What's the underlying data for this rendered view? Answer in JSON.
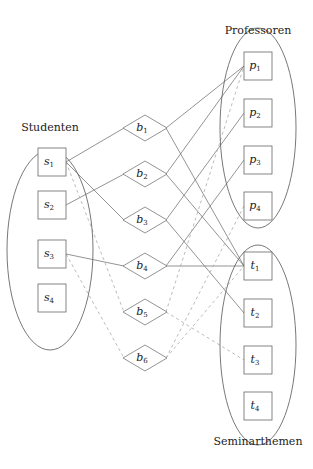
{
  "groups": {
    "students": {
      "label": "Studenten",
      "cx": 50,
      "cy": 250,
      "rx": 43,
      "ry": 100,
      "label_x": 50,
      "label_y": 131
    },
    "professors": {
      "label": "Professoren",
      "cx": 258,
      "cy": 128,
      "rx": 38,
      "ry": 100,
      "label_x": 258,
      "label_y": 34
    },
    "topics": {
      "label": "Seminarthemen",
      "cx": 258,
      "cy": 345,
      "rx": 38,
      "ry": 100,
      "label_x": 258,
      "label_y": 445
    }
  },
  "nodes": {
    "s1": {
      "base": "s",
      "sub": "1",
      "x": 52,
      "y": 162,
      "shape": "box"
    },
    "s2": {
      "base": "s",
      "sub": "2",
      "x": 52,
      "y": 205,
      "shape": "box"
    },
    "s3": {
      "base": "s",
      "sub": "3",
      "x": 52,
      "y": 254,
      "shape": "box"
    },
    "s4": {
      "base": "s",
      "sub": "4",
      "x": 52,
      "y": 298,
      "shape": "box"
    },
    "b1": {
      "base": "b",
      "sub": "1",
      "x": 145,
      "y": 128,
      "shape": "diamond"
    },
    "b2": {
      "base": "b",
      "sub": "2",
      "x": 145,
      "y": 174,
      "shape": "diamond"
    },
    "b3": {
      "base": "b",
      "sub": "3",
      "x": 145,
      "y": 220,
      "shape": "diamond"
    },
    "b4": {
      "base": "b",
      "sub": "4",
      "x": 145,
      "y": 266,
      "shape": "diamond"
    },
    "b5": {
      "base": "b",
      "sub": "5",
      "x": 145,
      "y": 312,
      "shape": "diamond"
    },
    "b6": {
      "base": "b",
      "sub": "6",
      "x": 145,
      "y": 358,
      "shape": "diamond"
    },
    "p1": {
      "base": "p",
      "sub": "1",
      "x": 258,
      "y": 66,
      "shape": "box"
    },
    "p2": {
      "base": "p",
      "sub": "2",
      "x": 258,
      "y": 113,
      "shape": "box"
    },
    "p3": {
      "base": "p",
      "sub": "3",
      "x": 258,
      "y": 160,
      "shape": "box"
    },
    "p4": {
      "base": "p",
      "sub": "4",
      "x": 258,
      "y": 206,
      "shape": "box"
    },
    "t1": {
      "base": "t",
      "sub": "1",
      "x": 258,
      "y": 266,
      "shape": "box"
    },
    "t2": {
      "base": "t",
      "sub": "2",
      "x": 258,
      "y": 313,
      "shape": "box"
    },
    "t3": {
      "base": "t",
      "sub": "3",
      "x": 258,
      "y": 360,
      "shape": "box"
    },
    "t4": {
      "base": "t",
      "sub": "4",
      "x": 258,
      "y": 406,
      "shape": "box"
    }
  },
  "edges": [
    {
      "from": "s1",
      "to": "b1",
      "style": "solid"
    },
    {
      "from": "s1",
      "to": "b3",
      "style": "solid"
    },
    {
      "from": "s2",
      "to": "b2",
      "style": "solid"
    },
    {
      "from": "s3",
      "to": "b4",
      "style": "solid"
    },
    {
      "from": "b1",
      "to": "p1",
      "style": "solid"
    },
    {
      "from": "b1",
      "to": "t1",
      "style": "solid"
    },
    {
      "from": "b2",
      "to": "p1",
      "style": "solid"
    },
    {
      "from": "b2",
      "to": "t1",
      "style": "solid"
    },
    {
      "from": "b3",
      "to": "p2",
      "style": "solid"
    },
    {
      "from": "b3",
      "to": "t2",
      "style": "solid"
    },
    {
      "from": "b4",
      "to": "p3",
      "style": "solid"
    },
    {
      "from": "b4",
      "to": "t1",
      "style": "solid"
    },
    {
      "from": "s1",
      "to": "b5",
      "style": "dashed"
    },
    {
      "from": "s3",
      "to": "b6",
      "style": "dashed"
    },
    {
      "from": "b5",
      "to": "p1",
      "style": "dashed"
    },
    {
      "from": "b5",
      "to": "t3",
      "style": "dashed"
    },
    {
      "from": "b6",
      "to": "p4",
      "style": "dashed"
    },
    {
      "from": "b6",
      "to": "t1",
      "style": "dashed"
    }
  ]
}
